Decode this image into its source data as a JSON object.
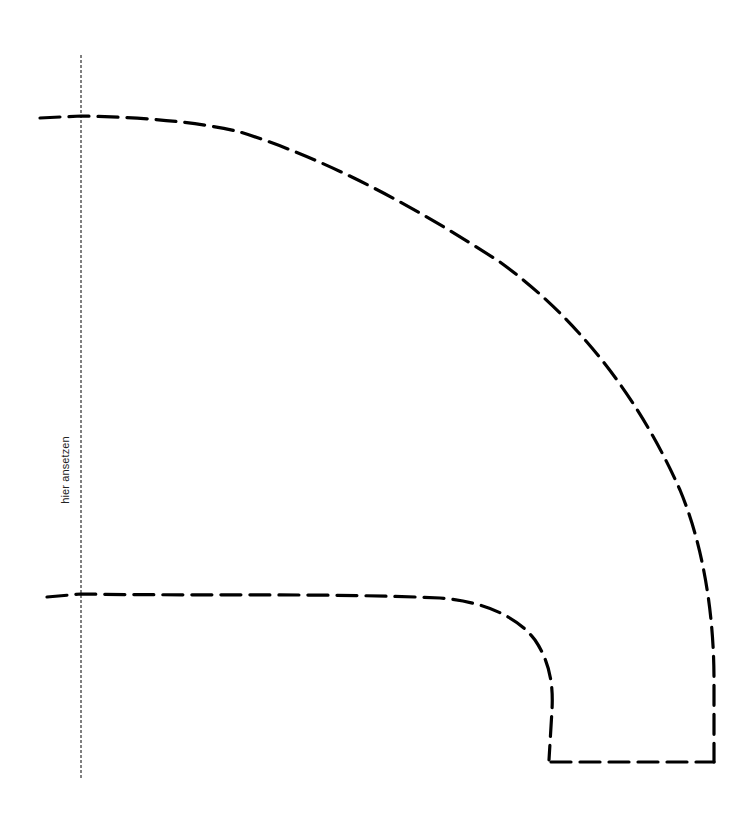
{
  "diagram": {
    "type": "sewing-pattern-template",
    "background": "#ffffff",
    "stroke_color": "#000000",
    "fold_line": {
      "label": "hier ansetzen",
      "style": "dotted",
      "x": 81,
      "y_start": 55,
      "y_end": 778
    },
    "outer_arc": {
      "style": "dashed",
      "description": "large quarter-circle cut line from top-left to bottom-right"
    },
    "inner_arc": {
      "style": "dashed",
      "description": "inner cut line running horizontally then curving down"
    },
    "bottom_edge": {
      "style": "dashed",
      "description": "short horizontal cut line closing the shape at the bottom"
    }
  }
}
